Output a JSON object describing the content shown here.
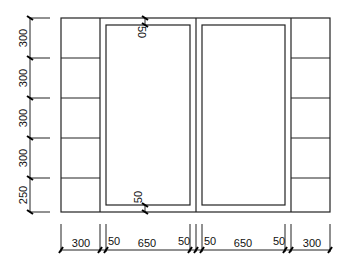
{
  "drawing": {
    "title": "",
    "vertical_dimensions": [
      "300",
      "300",
      "300",
      "300",
      "250"
    ],
    "horizontal_dimensions": [
      "300",
      "50",
      "650",
      "50",
      "50",
      "650",
      "50",
      "300"
    ],
    "inner_frame_offsets": {
      "top": "50",
      "bottom": "50"
    },
    "line_color": "#222222",
    "background": "#ffffff"
  }
}
